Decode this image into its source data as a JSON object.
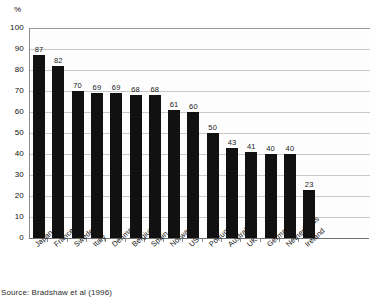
{
  "chart_data": {
    "type": "bar",
    "title": "",
    "xlabel": "",
    "ylabel": "%",
    "ylim": [
      0,
      100
    ],
    "ytick_step": 10,
    "yticks": [
      100,
      90,
      80,
      70,
      60,
      50,
      40,
      30,
      20,
      10,
      0
    ],
    "grid": true,
    "legend": null,
    "categories": [
      "Japan",
      "France",
      "Sweden",
      "Italy",
      "Denmark",
      "Belgium",
      "Spain",
      "Norway",
      "US",
      "Portugal",
      "Australia",
      "UK",
      "Germany",
      "Netherlands",
      "Ireland"
    ],
    "values": [
      87,
      82,
      70,
      69,
      69,
      68,
      68,
      61,
      60,
      50,
      43,
      41,
      40,
      40,
      23
    ],
    "bar_color": "#111111",
    "data_labels": [
      "87",
      "82",
      "70",
      "69",
      "69",
      "68",
      "68",
      "61",
      "60",
      "50",
      "43",
      "41",
      "40",
      "40",
      "23"
    ]
  },
  "axis": {
    "unit_label": "%"
  },
  "source": {
    "text": "Source: Bradshaw et al (1996)"
  }
}
